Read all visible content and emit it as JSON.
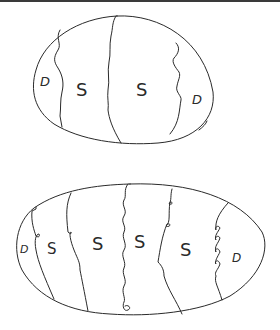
{
  "colors": {
    "background": "#ffffff",
    "ink": "#2a2a2a",
    "top_bar": "#3a3a3a"
  },
  "drawing": {
    "description": "Hand-drawn sketch of two decorated eggs divided into vertical bands with letter marks",
    "eggs": [
      {
        "name": "egg-top",
        "bands": 5,
        "labels": [
          "D",
          "S",
          "S",
          "D"
        ]
      },
      {
        "name": "egg-bottom",
        "bands": 7,
        "labels": [
          "D",
          "S",
          "S",
          "S",
          "S",
          "D"
        ]
      }
    ]
  },
  "text": {
    "top_left_d": "D",
    "top_s1": "S",
    "top_s2": "S",
    "top_right_d": "D",
    "bot_left_d": "D",
    "bot_s1": "S",
    "bot_s2": "S",
    "bot_s3": "S",
    "bot_s4": "S",
    "bot_right_d": "D"
  }
}
